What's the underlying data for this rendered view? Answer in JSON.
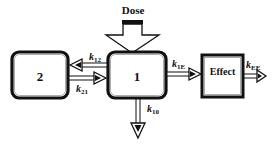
{
  "diagram": {
    "type": "pharmacokinetic-compartment-model",
    "dose_label": "Dose",
    "compartments": [
      {
        "id": "2",
        "label": "2"
      },
      {
        "id": "1",
        "label": "1"
      },
      {
        "id": "effect",
        "label": "Effect"
      }
    ],
    "rate_constants": {
      "k12": {
        "base": "k",
        "sub": "12"
      },
      "k21": {
        "base": "k",
        "sub": "21"
      },
      "k1E": {
        "base": "k",
        "sub": "1E"
      },
      "kEE": {
        "base": "k",
        "sub": "EE"
      },
      "k10": {
        "base": "k",
        "sub": "10"
      }
    },
    "colors": {
      "stroke": "#111111",
      "background": "#ffffff",
      "arrow_fill": "#d9d9d9"
    }
  }
}
